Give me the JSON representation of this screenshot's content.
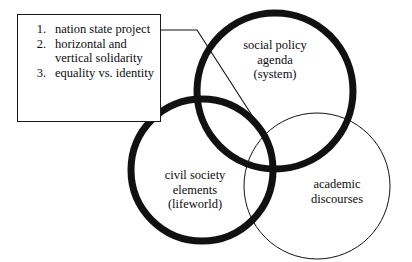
{
  "diagram": {
    "background_color": "#ffffff",
    "stroke_color": "#111111",
    "callout": {
      "name": "nation-state-project-callout",
      "border_color": "#1a1a1a",
      "items": [
        {
          "number": "1.",
          "text": "nation state project"
        },
        {
          "number": "2.",
          "text": "horizontal and vertical solidarity"
        },
        {
          "number": "3.",
          "text": "equality vs. identity"
        }
      ],
      "connector": {
        "name": "callout-leader-line",
        "from_x": 161,
        "from_y": 30,
        "elbow_x": 197,
        "elbow_y": 30,
        "to_x": 273,
        "to_y": 148
      }
    },
    "circles": [
      {
        "id": "social-policy-agenda",
        "label": "social policy\nagenda\n(system)",
        "cx": 275,
        "cy": 91,
        "r": 78,
        "stroke_width": 7,
        "emphasis": "thick"
      },
      {
        "id": "civil-society-elements",
        "label": "civil society\nelements\n(lifeworld)",
        "cx": 202,
        "cy": 170,
        "r": 71,
        "stroke_width": 7,
        "emphasis": "thick"
      },
      {
        "id": "academic-discourses",
        "label": "academic\ndiscourses",
        "cx": 317,
        "cy": 186,
        "r": 73,
        "stroke_width": 1,
        "emphasis": "thin"
      }
    ]
  }
}
